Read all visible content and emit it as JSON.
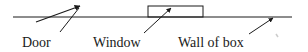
{
  "diagram": {
    "labels": {
      "door": "Door",
      "window": "Window",
      "wall": "Wall of box"
    },
    "colors": {
      "stroke": "#1a1a1a",
      "background": "#ffffff"
    }
  }
}
